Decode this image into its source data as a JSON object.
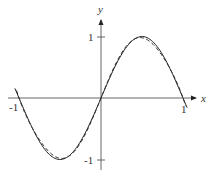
{
  "chart_data": {
    "type": "line",
    "title": "",
    "xlabel": "x",
    "ylabel": "y",
    "xlim": [
      -1.05,
      1.05
    ],
    "ylim": [
      -1,
      1
    ],
    "grid": false,
    "legend": null,
    "x_ticks": [
      {
        "value": -1,
        "label": "-1"
      },
      {
        "value": 1,
        "label": "1"
      }
    ],
    "y_ticks": [
      {
        "value": 1,
        "label": "1"
      },
      {
        "value": -1,
        "label": "-1"
      }
    ],
    "series": [
      {
        "name": "sin(pi x)",
        "style": "solid",
        "x": [
          -1.05,
          -0.75,
          -0.5,
          -0.25,
          0,
          0.25,
          0.5,
          0.75,
          1.05
        ],
        "values": [
          0.16,
          -0.71,
          -1.0,
          -0.71,
          0,
          0.71,
          1.0,
          0.71,
          -0.16
        ]
      },
      {
        "name": "polynomial approximation",
        "style": "dashed",
        "x": [
          -1.0,
          -0.75,
          -0.5,
          -0.25,
          0,
          0.25,
          0.5,
          0.75,
          1.0
        ],
        "values": [
          0.0,
          -0.68,
          -0.98,
          -0.73,
          0,
          0.73,
          0.98,
          0.68,
          0.0
        ]
      }
    ]
  },
  "axes": {
    "x_label": "x",
    "y_label": "y",
    "x_tick_neg": "-1",
    "x_tick_pos": "1",
    "y_tick_pos": "1",
    "y_tick_neg": "-1"
  },
  "style": {
    "axis_color": "#444444",
    "curve_color": "#222222",
    "dash_color": "#333333"
  }
}
